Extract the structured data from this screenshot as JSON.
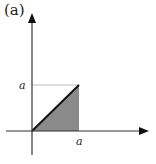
{
  "panel": {
    "label": "(a)"
  },
  "diagram": {
    "type": "shaded-triangle-region",
    "y_axis_tick_label": "a",
    "x_axis_tick_label": "a",
    "colors": {
      "axis": "#333333",
      "fill": "#8a8a8a",
      "diagonal": "#111111",
      "guide": "#bbbbbb"
    }
  }
}
